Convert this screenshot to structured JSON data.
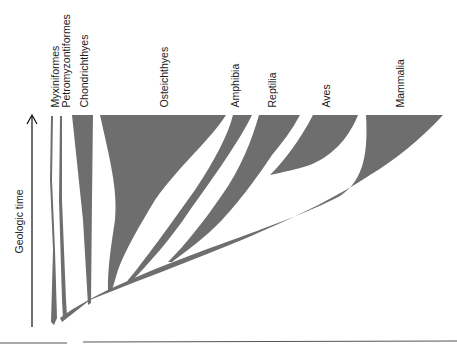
{
  "diagram": {
    "type": "phylogenetic-spindle-diagram",
    "axis": {
      "label": "Geologic time",
      "direction": "up"
    },
    "taxa": [
      {
        "name": "Myxiniformes"
      },
      {
        "name": "Petromyzontiformes"
      },
      {
        "name": "Chondrichthyes"
      },
      {
        "name": "Osteichthyes"
      },
      {
        "name": "Amphibia"
      },
      {
        "name": "Reptilia"
      },
      {
        "name": "Aves"
      },
      {
        "name": "Mammalia"
      }
    ],
    "colors": {
      "branch_fill": "#6e6e6e",
      "text": "#1a1a1a",
      "axis": "#111111",
      "baseline": "#555555"
    }
  }
}
